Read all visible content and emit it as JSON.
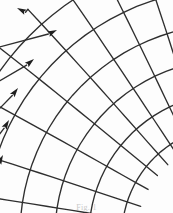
{
  "figure": {
    "caption": "Fig. 1",
    "background_color": "#fdfdfd",
    "ink_color": "#2e2e2e",
    "scan_artifact": true
  },
  "chart_data": {
    "type": "line",
    "xlabel": "",
    "ylabel": "",
    "xlim": [
      0,
      173
    ],
    "ylim": [
      0,
      213
    ],
    "grid": false,
    "legend": "none",
    "coordinate_system": {
      "kind": "polar-fan",
      "center_x": 232,
      "center_y": 236,
      "note": "Common center of the radial family lies outside the image to the lower-right; arcs are concentric about it."
    },
    "series": [
      {
        "name": "radial-arrow-1",
        "kind": "radial",
        "angle_deg": 228.0,
        "radius_start": 96,
        "radius_end": 305,
        "arrow": true,
        "arrow_tip": [
          17,
          8
        ],
        "curvature": 0.07
      },
      {
        "name": "radial-arrow-2",
        "kind": "radial",
        "angle_deg": 219.0,
        "radius_start": 96,
        "radius_end": 300,
        "arrow": true,
        "arrow_tip": [
          57,
          30
        ],
        "curvature": 0.07
      },
      {
        "name": "radial-arrow-3",
        "kind": "radial",
        "angle_deg": 209.0,
        "radius_start": 96,
        "radius_end": 292,
        "arrow": true,
        "arrow_tip": [
          34,
          59
        ],
        "curvature": 0.06
      },
      {
        "name": "radial-arrow-4",
        "kind": "radial",
        "angle_deg": 198.0,
        "radius_start": 96,
        "radius_end": 285,
        "arrow": true,
        "arrow_tip": [
          18,
          88
        ],
        "curvature": 0.05
      },
      {
        "name": "radial-arrow-5",
        "kind": "radial",
        "angle_deg": 189.0,
        "radius_start": 96,
        "radius_end": 280,
        "arrow": true,
        "arrow_tip": [
          9,
          120
        ],
        "curvature": 0.04
      },
      {
        "name": "radial-arrow-6",
        "kind": "radial",
        "angle_deg": 181.0,
        "radius_start": 96,
        "radius_end": 278,
        "arrow": true,
        "arrow_tip": [
          3,
          155
        ],
        "curvature": 0.03
      },
      {
        "name": "radial-plain-7",
        "kind": "radial",
        "angle_deg": 236.0,
        "radius_start": 96,
        "radius_end": 300,
        "arrow": false,
        "curvature": 0.07
      },
      {
        "name": "radial-plain-8",
        "kind": "radial",
        "angle_deg": 244.0,
        "radius_start": 96,
        "radius_end": 295,
        "arrow": false,
        "curvature": 0.07
      },
      {
        "name": "radial-plain-9",
        "kind": "radial",
        "angle_deg": 252.0,
        "radius_start": 96,
        "radius_end": 290,
        "arrow": false,
        "curvature": 0.07
      },
      {
        "name": "radial-plain-10",
        "kind": "radial",
        "angle_deg": 259.0,
        "radius_start": 96,
        "radius_end": 286,
        "arrow": false,
        "curvature": 0.06
      },
      {
        "name": "radial-plain-11",
        "kind": "radial",
        "angle_deg": 265.0,
        "radius_start": 118,
        "radius_end": 282,
        "arrow": false,
        "curvature": 0.06
      },
      {
        "name": "radial-plain-12",
        "kind": "radial",
        "angle_deg": 271.0,
        "radius_start": 140,
        "radius_end": 278,
        "arrow": false,
        "curvature": 0.05
      }
    ],
    "arcs": [
      {
        "name": "arc-1",
        "radius": 110,
        "angle_start_deg": 178,
        "angle_end_deg": 274,
        "bow": 0.05
      },
      {
        "name": "arc-2",
        "radius": 143,
        "angle_start_deg": 178,
        "angle_end_deg": 274,
        "bow": 0.05
      },
      {
        "name": "arc-3",
        "radius": 177,
        "angle_start_deg": 178,
        "angle_end_deg": 274,
        "bow": 0.05
      },
      {
        "name": "arc-4",
        "radius": 212,
        "angle_start_deg": 178,
        "angle_end_deg": 272,
        "bow": 0.05
      },
      {
        "name": "arc-5",
        "radius": 248,
        "angle_start_deg": 179,
        "angle_end_deg": 268,
        "bow": 0.05
      },
      {
        "name": "arc-6",
        "radius": 284,
        "angle_start_deg": 181,
        "angle_end_deg": 262,
        "bow": 0.05
      }
    ],
    "counts": {
      "radial_lines_total": 12,
      "radial_lines_with_arrows": 6,
      "arcs_total": 6
    }
  }
}
